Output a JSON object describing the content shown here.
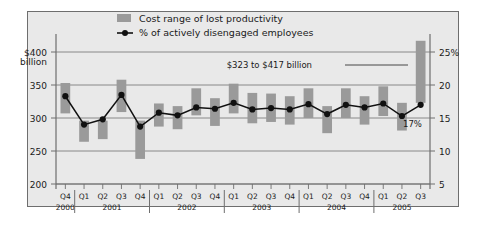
{
  "chart_data": {
    "type": "bar",
    "title": "",
    "subtitle": "",
    "xlabel": "",
    "ylabel": "",
    "y_left": {
      "label_top": "$400",
      "label_top_unit": "billion",
      "ticks": [
        "$400",
        "350",
        "300",
        "250",
        "200"
      ],
      "tick_values": [
        400,
        350,
        300,
        250,
        200
      ],
      "range": [
        200,
        400
      ],
      "unit": "billion"
    },
    "y_right": {
      "ticks": [
        "25%",
        "20",
        "15",
        "10",
        "5"
      ],
      "tick_values": [
        25,
        20,
        15,
        10,
        5
      ],
      "range": [
        5,
        25
      ],
      "unit": "%"
    },
    "categories": [
      "Q4",
      "Q1",
      "Q2",
      "Q3",
      "Q4",
      "Q1",
      "Q2",
      "Q3",
      "Q4",
      "Q1",
      "Q2",
      "Q3",
      "Q4",
      "Q1",
      "Q2",
      "Q3",
      "Q4",
      "Q1",
      "Q2",
      "Q3"
    ],
    "year_groups": [
      {
        "year": "2000",
        "quarters": [
          "Q4"
        ]
      },
      {
        "year": "2001",
        "quarters": [
          "Q1",
          "Q2",
          "Q3",
          "Q4"
        ]
      },
      {
        "year": "2002",
        "quarters": [
          "Q1",
          "Q2",
          "Q3",
          "Q4"
        ]
      },
      {
        "year": "2003",
        "quarters": [
          "Q1",
          "Q2",
          "Q3",
          "Q4"
        ]
      },
      {
        "year": "2004",
        "quarters": [
          "Q1",
          "Q2",
          "Q3",
          "Q4"
        ]
      },
      {
        "year": "2005",
        "quarters": [
          "Q1",
          "Q2",
          "Q3"
        ]
      }
    ],
    "grid": true,
    "legend_position": "top",
    "series": [
      {
        "name": "Cost range of lost productivity",
        "type": "range-bar",
        "axis": "left",
        "unit": "$ billion",
        "color": "#9a9a9a",
        "ranges": [
          [
            307,
            353
          ],
          [
            264,
            296
          ],
          [
            268,
            296
          ],
          [
            309,
            358
          ],
          [
            238,
            296
          ],
          [
            287,
            322
          ],
          [
            283,
            318
          ],
          [
            304,
            345
          ],
          [
            288,
            330
          ],
          [
            307,
            352
          ],
          [
            292,
            338
          ],
          [
            294,
            337
          ],
          [
            290,
            333
          ],
          [
            300,
            345
          ],
          [
            277,
            318
          ],
          [
            300,
            345
          ],
          [
            290,
            333
          ],
          [
            303,
            348
          ],
          [
            281,
            323
          ],
          [
            323,
            417
          ]
        ]
      },
      {
        "name": "% of actively disengaged employees",
        "type": "line",
        "axis": "right",
        "unit": "%",
        "color": "#111111",
        "values": [
          18.3,
          14.0,
          14.8,
          18.5,
          13.7,
          15.8,
          15.4,
          16.6,
          16.4,
          17.3,
          16.3,
          16.5,
          16.3,
          17.1,
          15.6,
          17.0,
          16.6,
          17.2,
          15.3,
          17.0
        ]
      }
    ],
    "annotations": [
      {
        "name": "cost-range-callout",
        "text": "$323 to $417 billion",
        "points_to": "Q3 2005 bar"
      },
      {
        "name": "disengaged-percent-callout",
        "text": "17%",
        "points_to": "Q3 2005 line point"
      }
    ]
  },
  "legend": {
    "items": [
      {
        "label": "Cost range of lost productivity",
        "marker": "swatch",
        "color": "#9a9a9a"
      },
      {
        "label": "% of actively disengaged employees",
        "marker": "line-dot",
        "color": "#111111"
      }
    ]
  },
  "colors": {
    "panel_background": "#e9e9e9",
    "panel_border": "#6e6e6e",
    "bar": "#9a9a9a",
    "line": "#111111",
    "gridline": "#6e6e6e",
    "text": "#1a1a1a"
  }
}
